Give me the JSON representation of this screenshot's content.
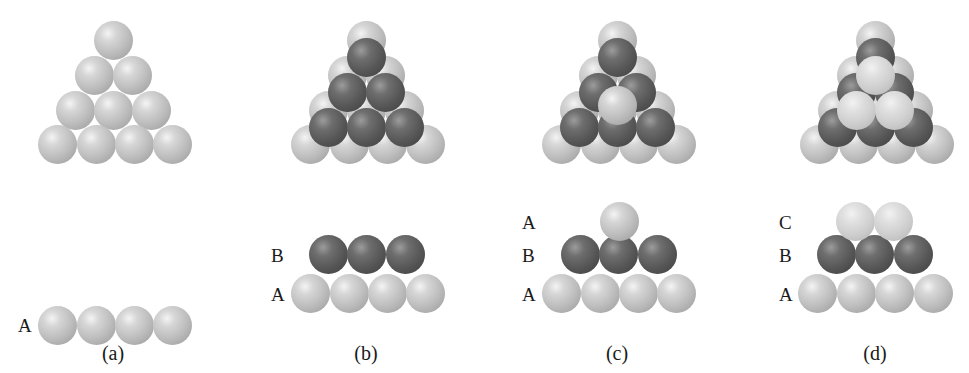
{
  "figure": {
    "sphere_radius": 19.5,
    "colors": {
      "light": "#bdbdbd",
      "dark": "#555555",
      "pale": "#d4d4d4"
    },
    "panels": [
      {
        "id": "a",
        "caption": "(a)",
        "caption_pos": [
          113,
          343
        ],
        "top_view": [
          {
            "layer": "A",
            "tone": "light",
            "centers": [
              [
                113,
                40
              ],
              [
                94,
                75
              ],
              [
                132,
                75
              ],
              [
                75,
                110
              ],
              [
                113,
                110
              ],
              [
                151,
                110
              ],
              [
                57,
                144
              ],
              [
                96,
                144
              ],
              [
                134,
                144
              ],
              [
                172,
                144
              ]
            ]
          }
        ],
        "side_view": {
          "labels": [
            {
              "text": "A",
              "pos": [
                18,
                316
              ]
            }
          ],
          "rows": [
            {
              "layer": "A",
              "tone": "light",
              "centers": [
                [
                  57,
                  325
                ],
                [
                  96,
                  325
                ],
                [
                  134,
                  325
                ],
                [
                  172,
                  325
                ]
              ]
            }
          ]
        }
      },
      {
        "id": "b",
        "caption": "(b)",
        "caption_pos": [
          366,
          343
        ],
        "top_view": [
          {
            "layer": "A",
            "tone": "light",
            "centers": [
              [
                366,
                40
              ],
              [
                347,
                75
              ],
              [
                385,
                75
              ],
              [
                328,
                110
              ],
              [
                366,
                110
              ],
              [
                404,
                110
              ],
              [
                310,
                144
              ],
              [
                349,
                144
              ],
              [
                387,
                144
              ],
              [
                425,
                144
              ]
            ]
          },
          {
            "layer": "B",
            "tone": "dark",
            "centers": [
              [
                366,
                57
              ],
              [
                347,
                92
              ],
              [
                385,
                92
              ],
              [
                328,
                127
              ],
              [
                366,
                127
              ],
              [
                404,
                127
              ]
            ]
          }
        ],
        "side_view": {
          "labels": [
            {
              "text": "B",
              "pos": [
                271,
                246
              ]
            },
            {
              "text": "A",
              "pos": [
                271,
                285
              ]
            }
          ],
          "rows": [
            {
              "layer": "A",
              "tone": "light",
              "centers": [
                [
                  310,
                  293
                ],
                [
                  349,
                  293
                ],
                [
                  387,
                  293
                ],
                [
                  425,
                  293
                ]
              ]
            },
            {
              "layer": "B",
              "tone": "dark",
              "centers": [
                [
                  328,
                  254
                ],
                [
                  366,
                  254
                ],
                [
                  405,
                  254
                ]
              ]
            }
          ]
        }
      },
      {
        "id": "c",
        "caption": "(c)",
        "caption_pos": [
          617,
          343
        ],
        "top_view": [
          {
            "layer": "A",
            "tone": "light",
            "centers": [
              [
                617,
                40
              ],
              [
                598,
                75
              ],
              [
                636,
                75
              ],
              [
                579,
                110
              ],
              [
                617,
                110
              ],
              [
                655,
                110
              ],
              [
                561,
                144
              ],
              [
                600,
                144
              ],
              [
                638,
                144
              ],
              [
                676,
                144
              ]
            ]
          },
          {
            "layer": "B",
            "tone": "dark",
            "centers": [
              [
                617,
                57
              ],
              [
                598,
                92
              ],
              [
                636,
                92
              ],
              [
                579,
                127
              ],
              [
                617,
                127
              ],
              [
                655,
                127
              ]
            ]
          },
          {
            "layer": "A",
            "tone": "light",
            "centers": [
              [
                617,
                105
              ]
            ]
          }
        ],
        "side_view": {
          "labels": [
            {
              "text": "A",
              "pos": [
                522,
                213
              ]
            },
            {
              "text": "B",
              "pos": [
                522,
                246
              ]
            },
            {
              "text": "A",
              "pos": [
                522,
                285
              ]
            }
          ],
          "rows": [
            {
              "layer": "A",
              "tone": "light",
              "centers": [
                [
                  561,
                  293
                ],
                [
                  600,
                  293
                ],
                [
                  638,
                  293
                ],
                [
                  676,
                  293
                ]
              ]
            },
            {
              "layer": "B",
              "tone": "dark",
              "centers": [
                [
                  580,
                  254
                ],
                [
                  618,
                  254
                ],
                [
                  657,
                  254
                ]
              ]
            },
            {
              "layer": "A",
              "tone": "light",
              "centers": [
                [
                  619,
                  221
                ]
              ]
            }
          ]
        }
      },
      {
        "id": "d",
        "caption": "(d)",
        "caption_pos": [
          875,
          343
        ],
        "top_view": [
          {
            "layer": "A",
            "tone": "light",
            "centers": [
              [
                875,
                40
              ],
              [
                856,
                75
              ],
              [
                894,
                75
              ],
              [
                837,
                110
              ],
              [
                875,
                110
              ],
              [
                913,
                110
              ],
              [
                819,
                144
              ],
              [
                858,
                144
              ],
              [
                896,
                144
              ],
              [
                934,
                144
              ]
            ]
          },
          {
            "layer": "B",
            "tone": "dark",
            "centers": [
              [
                875,
                57
              ],
              [
                856,
                92
              ],
              [
                894,
                92
              ],
              [
                837,
                127
              ],
              [
                875,
                127
              ],
              [
                913,
                127
              ]
            ]
          },
          {
            "layer": "C",
            "tone": "pale",
            "centers": [
              [
                875,
                75
              ],
              [
                856,
                110
              ],
              [
                894,
                110
              ]
            ]
          }
        ],
        "side_view": {
          "labels": [
            {
              "text": "C",
              "pos": [
                779,
                213
              ]
            },
            {
              "text": "B",
              "pos": [
                779,
                246
              ]
            },
            {
              "text": "A",
              "pos": [
                779,
                285
              ]
            }
          ],
          "rows": [
            {
              "layer": "A",
              "tone": "light",
              "centers": [
                [
                  817,
                  293
                ],
                [
                  856,
                  293
                ],
                [
                  894,
                  293
                ],
                [
                  933,
                  293
                ]
              ]
            },
            {
              "layer": "B",
              "tone": "dark",
              "centers": [
                [
                  836,
                  254
                ],
                [
                  874,
                  254
                ],
                [
                  913,
                  254
                ]
              ]
            },
            {
              "layer": "C",
              "tone": "pale",
              "centers": [
                [
                  855,
                  221
                ],
                [
                  893,
                  221
                ]
              ]
            }
          ]
        }
      }
    ]
  }
}
